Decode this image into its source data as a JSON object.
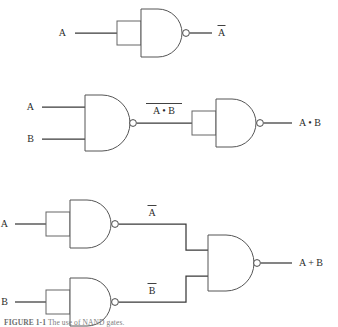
{
  "figure": {
    "background_color": "#ffffff",
    "line_color": "#4a4a4a",
    "text_color": "#2b2b2b",
    "caption_number": "FIGURE 1-1",
    "caption_text": "The use of NAND gates.",
    "caption_color": "#7d7d7d"
  },
  "circuits": [
    {
      "id": "inverter",
      "name": "nand-as-inverter",
      "inputs": [
        {
          "label": "A",
          "overline": false
        }
      ],
      "gates": [
        {
          "type": "NAND",
          "inputs": 1,
          "has_bubble": true
        }
      ],
      "output": {
        "label": "A",
        "overline": true
      },
      "intermediate_labels": []
    },
    {
      "id": "and",
      "name": "nand-as-and",
      "inputs": [
        {
          "label": "A",
          "overline": false
        },
        {
          "label": "B",
          "overline": false
        }
      ],
      "gates": [
        {
          "type": "NAND",
          "inputs": 2,
          "has_bubble": true
        },
        {
          "type": "NAND",
          "inputs": 1,
          "has_bubble": true
        }
      ],
      "intermediate_labels": [
        {
          "label": "A • B",
          "overline": true
        }
      ],
      "output": {
        "label": "A • B",
        "overline": false
      }
    },
    {
      "id": "or",
      "name": "nand-as-or",
      "inputs": [
        {
          "label": "A",
          "overline": false
        },
        {
          "label": "B",
          "overline": false
        }
      ],
      "gates": [
        {
          "type": "NAND",
          "inputs": 1,
          "has_bubble": true
        },
        {
          "type": "NAND",
          "inputs": 1,
          "has_bubble": true
        },
        {
          "type": "NAND",
          "inputs": 2,
          "has_bubble": true
        }
      ],
      "intermediate_labels": [
        {
          "label": "A",
          "overline": true
        },
        {
          "label": "B",
          "overline": true
        }
      ],
      "output": {
        "label": "A + B",
        "overline": false
      }
    }
  ],
  "labels": {
    "c1_in_a": "A",
    "c1_out_a": "A",
    "c2_in_a": "A",
    "c2_in_b": "B",
    "c2_mid": "A • B",
    "c2_out": "A • B",
    "c3_in_a": "A",
    "c3_in_b": "B",
    "c3_mid_a": "A",
    "c3_mid_b": "B",
    "c3_out": "A + B"
  }
}
